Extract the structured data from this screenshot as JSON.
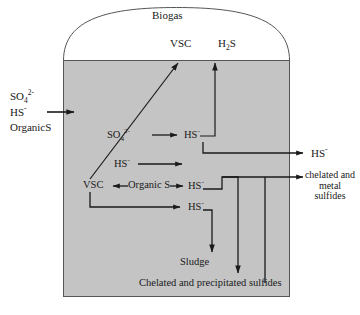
{
  "diagram": {
    "vessel": {
      "name": "anaerobic digester vessel",
      "fill_color": "#c4c4c4",
      "stroke_color": "#4d4d4d",
      "headspace_label": "Biogas"
    },
    "gas_products": [
      {
        "id": "vsc-gas",
        "label": "VSC"
      },
      {
        "id": "h2s-gas",
        "label": "H",
        "label_sub": "2",
        "label_tail": "S"
      }
    ],
    "inlet": {
      "name": "feed stream",
      "species": [
        {
          "base": "SO",
          "sub": "4",
          "sup": "2-"
        },
        {
          "base": "HS",
          "sup": "-"
        },
        {
          "base": "OrganicS"
        }
      ]
    },
    "reactions": [
      {
        "id": "sulfate-reduction",
        "from": "SO",
        "from_sub": "4",
        "from_sup": "2-",
        "to": "HS",
        "to_sup": "-"
      },
      {
        "id": "hs-transfer",
        "from": "HS",
        "from_sup": "-",
        "to": ""
      },
      {
        "id": "organic-s-split",
        "left": "VSC",
        "center": "Organic S",
        "right": "HS",
        "right_sup": "-"
      },
      {
        "id": "vsc-recycle",
        "to": "HS",
        "to_sup": "-"
      }
    ],
    "outlets": [
      {
        "id": "hs-effluent",
        "label": "HS",
        "sup": "-"
      },
      {
        "id": "chelated-metal-sulfides",
        "line1": "chelated and",
        "line2": "metal",
        "line3": "sulfides"
      }
    ],
    "bottom_products": [
      {
        "id": "sludge",
        "label": "Sludge"
      },
      {
        "id": "precipitated",
        "label": "Chelated and precipitated sulfides"
      }
    ]
  }
}
